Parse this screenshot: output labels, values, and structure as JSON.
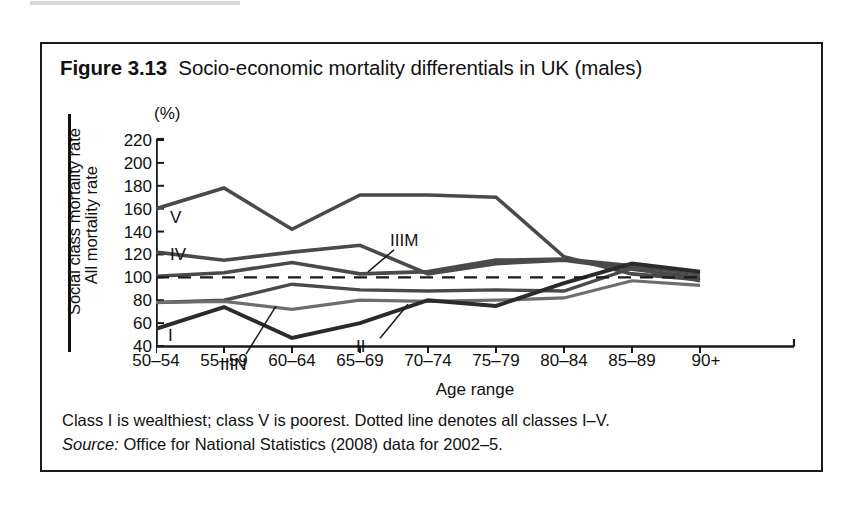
{
  "figure": {
    "number": "Figure 3.13",
    "title": "Socio-economic mortality differentials in UK (males)"
  },
  "axis": {
    "y_title_numerator": "Social class mortality rate",
    "y_title_denominator": "All mortality rate",
    "y_unit": "(%)",
    "x_title": "Age range"
  },
  "footnotes": {
    "note": "Class I is wealthiest; class V is poorest. Dotted line denotes all classes I–V.",
    "source_label": "Source:",
    "source_text": "Office for National Statistics (2008) data for 2002–5."
  },
  "colors": {
    "ink": "#1a1a1a",
    "line_dark": "#2b2b2b",
    "line_mid": "#4a4a4a",
    "line_light": "#6d6d6d",
    "frame": "#1a1a1a"
  },
  "chart_data": {
    "type": "line",
    "title": "Socio-economic mortality differentials in UK (males)",
    "xlabel": "Age range",
    "ylabel": "Social class mortality rate / All mortality rate (%)",
    "ylim": [
      40,
      220
    ],
    "yticks": [
      40,
      60,
      80,
      100,
      120,
      140,
      160,
      180,
      200,
      220
    ],
    "grid": false,
    "legend": "inline-labels",
    "categories": [
      "50–54",
      "55–59",
      "60–64",
      "65–69",
      "70–74",
      "75–79",
      "80–84",
      "85–89",
      "90+"
    ],
    "series": [
      {
        "name": "V",
        "label": "V",
        "values": [
          160,
          178,
          142,
          172,
          172,
          170,
          118,
          103,
          98
        ]
      },
      {
        "name": "IV",
        "label": "IV",
        "values": [
          122,
          115,
          122,
          128,
          103,
          112,
          115,
          107,
          100
        ]
      },
      {
        "name": "IIIM",
        "label": "IIIM",
        "values": [
          101,
          104,
          113,
          103,
          105,
          115,
          116,
          110,
          103
        ]
      },
      {
        "name": "IIIN",
        "label": "IIIN",
        "values": [
          78,
          80,
          94,
          89,
          88,
          89,
          88,
          108,
          97
        ]
      },
      {
        "name": "II",
        "label": "II",
        "values": [
          78,
          79,
          72,
          80,
          79,
          80,
          82,
          97,
          93
        ]
      },
      {
        "name": "I",
        "label": "I",
        "values": [
          55,
          74,
          47,
          60,
          80,
          75,
          95,
          112,
          105
        ]
      },
      {
        "name": "all classes I–V",
        "label": "",
        "style": "dashed",
        "values": [
          100,
          100,
          100,
          100,
          100,
          100,
          100,
          100,
          100
        ]
      }
    ],
    "annotations": [
      {
        "text": "V",
        "series": "V",
        "x": "50–54"
      },
      {
        "text": "IV",
        "series": "IV",
        "x": "50–54"
      },
      {
        "text": "IIIM",
        "series": "IIIM",
        "x": "65–69"
      },
      {
        "text": "IIIN",
        "series": "IIIN",
        "x": "55–59"
      },
      {
        "text": "II",
        "series": "II",
        "x": "65–69"
      },
      {
        "text": "I",
        "series": "I",
        "x": "50–54"
      }
    ]
  }
}
